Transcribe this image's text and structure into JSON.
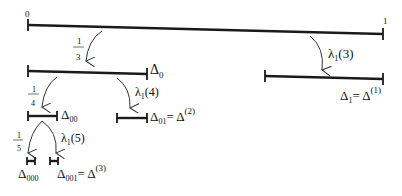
{
  "diagram": {
    "endpoints": {
      "left": "0",
      "right": "1"
    },
    "intervals": [
      {
        "id": "root",
        "label": ""
      },
      {
        "id": "d0",
        "label": "Δ",
        "sub": "0"
      },
      {
        "id": "d1",
        "label": "Δ",
        "sub": "1",
        "eq": "= Δ",
        "sup": "(1)"
      },
      {
        "id": "d00",
        "label": "Δ",
        "sub": "00"
      },
      {
        "id": "d01",
        "label": "Δ",
        "sub": "01",
        "eq": "= Δ",
        "sup": "(2)"
      },
      {
        "id": "d000",
        "label": "Δ",
        "sub": "000"
      },
      {
        "id": "d001",
        "label": "Δ",
        "sub": "001",
        "eq": "= Δ",
        "sup": "(3)"
      }
    ],
    "arrows": [
      {
        "id": "a13",
        "num": "1",
        "den": "3"
      },
      {
        "id": "l3",
        "label": "λ",
        "sub": "1",
        "arg": "(3)"
      },
      {
        "id": "a14",
        "num": "1",
        "den": "4"
      },
      {
        "id": "l4",
        "label": "λ",
        "sub": "1",
        "arg": "(4)"
      },
      {
        "id": "a15",
        "num": "1",
        "den": "5"
      },
      {
        "id": "l5",
        "label": "λ",
        "sub": "1",
        "arg": "(5)"
      }
    ]
  }
}
